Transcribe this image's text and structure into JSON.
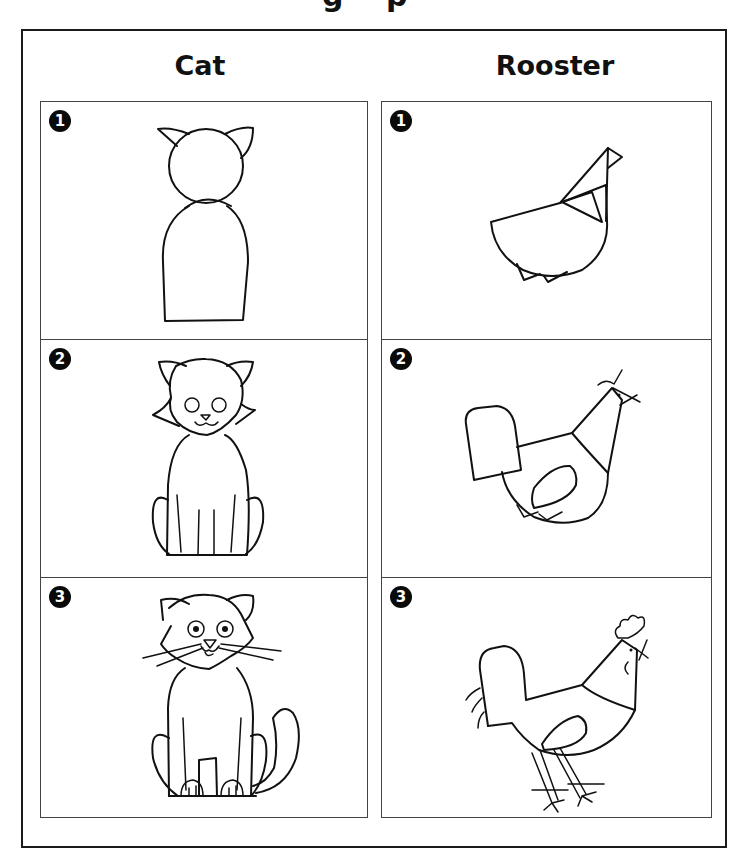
{
  "page": {
    "title_remnant": "g p",
    "columns": [
      {
        "header": "Cat",
        "steps": [
          {
            "number": "1",
            "description": "Circle head with two pointed ears on top of a tall rounded body"
          },
          {
            "number": "2",
            "description": "Add round eyes, nose, smiling mouth, cheek tufts, front legs and rounded haunches"
          },
          {
            "number": "3",
            "description": "Add pupils, whiskers, paws with toes and a curling tail"
          }
        ]
      },
      {
        "header": "Rooster",
        "steps": [
          {
            "number": "1",
            "description": "Half-circle body with triangular neck and head, two small triangles below"
          },
          {
            "number": "2",
            "description": "Add tall rounded tail, wing oval, beak, eye and comb stroke"
          },
          {
            "number": "3",
            "description": "Add comb, wattle, tail feathers, legs and clawed feet"
          }
        ]
      }
    ]
  },
  "colors": {
    "ink": "#111111",
    "background": "#ffffff",
    "badge": "#0a0a0a",
    "badge_text": "#ffffff"
  }
}
